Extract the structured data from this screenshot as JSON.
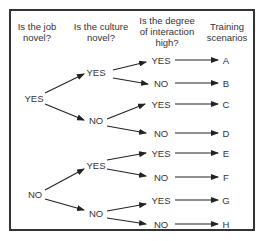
{
  "headers": {
    "q1": "Is the job novel?",
    "q1_line1": "Is the job",
    "q1_line2": "novel?",
    "q2_line1": "Is the culture",
    "q2_line2": "novel?",
    "q3_line1": "Is the degree",
    "q3_line2": "of interaction",
    "q3_line3": "high?",
    "q4_line1": "Training",
    "q4_line2": "scenarios"
  },
  "tree": {
    "level1": [
      "YES",
      "NO"
    ],
    "level2": [
      "YES",
      "NO",
      "YES",
      "NO"
    ],
    "level3": [
      "YES",
      "NO",
      "YES",
      "NO",
      "YES",
      "NO",
      "YES",
      "NO"
    ],
    "scenarios": [
      "A",
      "B",
      "C",
      "D",
      "E",
      "F",
      "G",
      "H"
    ]
  }
}
